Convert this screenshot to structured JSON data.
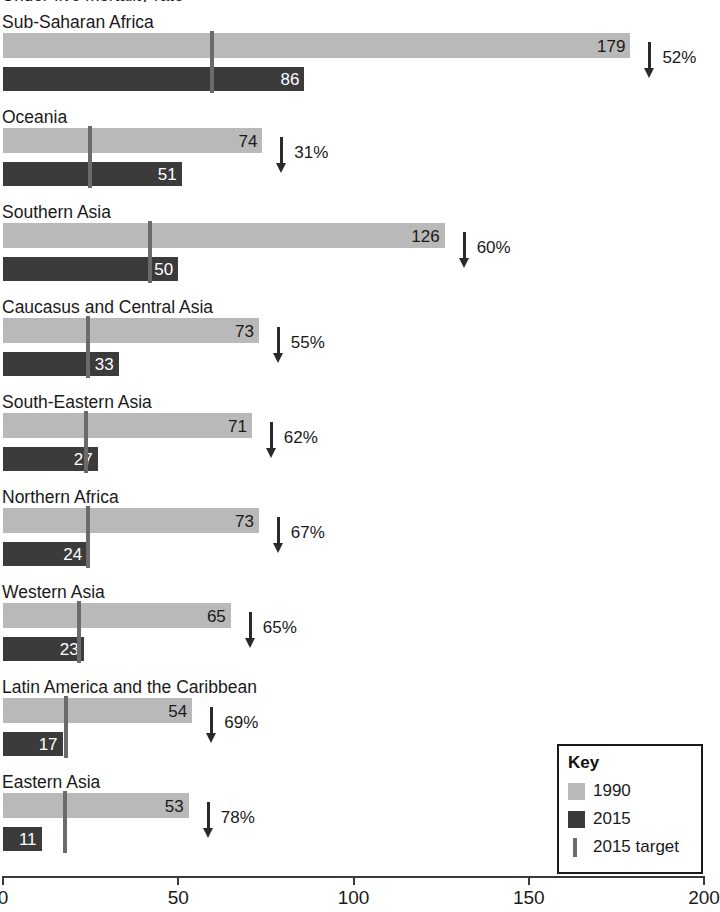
{
  "chart_data": {
    "type": "bar",
    "title": "Under-five mortality rate",
    "orientation": "horizontal",
    "categories": [
      "Sub-Saharan Africa",
      "Oceania",
      "Southern Asia",
      "Caucasus and Central Asia",
      "South-Eastern Asia",
      "Northern Africa",
      "Western Asia",
      "Latin America and the Caribbean",
      "Eastern Asia"
    ],
    "series": [
      {
        "name": "1990",
        "color": "#b9b9b9",
        "values": [
          179,
          74,
          126,
          73,
          71,
          73,
          65,
          54,
          53
        ]
      },
      {
        "name": "2015",
        "color": "#3b3b3b",
        "values": [
          86,
          51,
          50,
          33,
          27,
          24,
          23,
          17,
          11
        ]
      }
    ],
    "target_marker": {
      "name": "2015 target",
      "color": "#6b6b6b",
      "values": [
        59.7,
        24.7,
        42.0,
        24.3,
        23.7,
        24.3,
        21.7,
        18.0,
        17.7
      ]
    },
    "reductions": [
      "52%",
      "31%",
      "60%",
      "55%",
      "62%",
      "67%",
      "65%",
      "69%",
      "78%"
    ],
    "xlabel": "",
    "ylabel": "",
    "xlim": [
      0,
      200
    ],
    "xticks": [
      0,
      50,
      100,
      150,
      200
    ],
    "xtick_labels": [
      "0",
      "50",
      "100",
      "150",
      "200"
    ],
    "grid": false,
    "legend": {
      "position": "bottom-right",
      "title": "Key",
      "entries": [
        {
          "label": "1990",
          "swatch": "light-gray-square"
        },
        {
          "label": "2015",
          "swatch": "dark-gray-square"
        },
        {
          "label": "2015 target",
          "swatch": "gray-vertical-bar"
        }
      ]
    }
  },
  "groups": [
    {
      "label": "Sub-Saharan Africa",
      "v1990": "179",
      "v2015": "86",
      "reduction": "52%"
    },
    {
      "label": "Oceania",
      "v1990": "74",
      "v2015": "51",
      "reduction": "31%"
    },
    {
      "label": "Southern Asia",
      "v1990": "126",
      "v2015": "50",
      "reduction": "60%"
    },
    {
      "label": "Caucasus and Central Asia",
      "v1990": "73",
      "v2015": "33",
      "reduction": "55%"
    },
    {
      "label": "South-Eastern Asia",
      "v1990": "71",
      "v2015": "27",
      "reduction": "62%"
    },
    {
      "label": "Northern Africa",
      "v1990": "73",
      "v2015": "24",
      "reduction": "67%"
    },
    {
      "label": "Western Asia",
      "v1990": "65",
      "v2015": "23",
      "reduction": "65%"
    },
    {
      "label": "Latin America and the Caribbean",
      "v1990": "54",
      "v2015": "17",
      "reduction": "69%"
    },
    {
      "label": "Eastern Asia",
      "v1990": "53",
      "v2015": "11",
      "reduction": "78%"
    }
  ],
  "legend": {
    "title": "Key",
    "item_1990": "1990",
    "item_2015": "2015",
    "item_target": "2015 target"
  },
  "axis": {
    "ticks": [
      "0",
      "50",
      "100",
      "150",
      "200"
    ]
  },
  "title_sliver": "Under-five mortality rate"
}
